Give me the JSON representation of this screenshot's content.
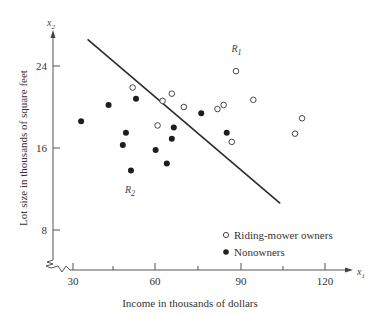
{
  "chart_data": {
    "type": "scatter",
    "title": "",
    "xlabel": "Income in thousands of dollars",
    "ylabel": "Lot size in thousands of square feet",
    "x_axis_var": "x1",
    "y_axis_var": "x2",
    "xlim": [
      27,
      130
    ],
    "ylim": [
      1.5,
      28
    ],
    "x_ticks": [
      30,
      45,
      60,
      75,
      90,
      105,
      120
    ],
    "x_tick_labels": [
      "30",
      "",
      "60",
      "",
      "90",
      "",
      "120"
    ],
    "y_ticks": [
      8,
      16,
      24
    ],
    "y_tick_labels": [
      "8",
      "16",
      "24"
    ],
    "grid": false,
    "axis_breaks": true,
    "legend_position": "lower right",
    "series": [
      {
        "name": "Riding-mower owners",
        "marker": "open-circle",
        "points": [
          [
            51.3,
            21.9
          ],
          [
            62.0,
            20.6
          ],
          [
            65.3,
            21.3
          ],
          [
            69.6,
            20.0
          ],
          [
            60.2,
            18.2
          ],
          [
            81.6,
            19.8
          ],
          [
            83.8,
            20.2
          ],
          [
            88.2,
            23.5
          ],
          [
            94.4,
            20.7
          ],
          [
            86.7,
            16.6
          ],
          [
            109.3,
            17.4
          ],
          [
            111.8,
            18.9
          ]
        ]
      },
      {
        "name": "Nonowners",
        "marker": "filled-circle",
        "points": [
          [
            32.9,
            18.6
          ],
          [
            42.7,
            20.2
          ],
          [
            52.5,
            20.8
          ],
          [
            48.9,
            17.5
          ],
          [
            47.8,
            16.3
          ],
          [
            50.7,
            13.8
          ],
          [
            59.5,
            15.8
          ],
          [
            63.5,
            14.5
          ],
          [
            65.3,
            16.9
          ],
          [
            66.0,
            18.0
          ],
          [
            75.8,
            19.4
          ],
          [
            84.9,
            17.5
          ]
        ]
      }
    ],
    "decision_line": {
      "from": [
        35.2,
        26.6
      ],
      "to": [
        104.0,
        10.6
      ]
    },
    "region_labels": [
      {
        "label": "R1",
        "x": 88,
        "y": 25.8
      },
      {
        "label": "R2",
        "x": 50,
        "y": 12.0
      }
    ]
  },
  "labels": {
    "x_var": "x",
    "x_var_sub": "1",
    "y_var": "x",
    "y_var_sub": "2",
    "r1": "R",
    "r1_sub": "1",
    "r2": "R",
    "r2_sub": "2",
    "xlabel": "Income in thousands of dollars",
    "ylabel": "Lot size in thousands of square feet",
    "legend_owners": "Riding-mower owners",
    "legend_nonowners": "Nonowners",
    "tick_x_30": "30",
    "tick_x_60": "60",
    "tick_x_90": "90",
    "tick_x_120": "120",
    "tick_y_8": "8",
    "tick_y_16": "16",
    "tick_y_24": "24"
  },
  "colors": {
    "ink": "#222222",
    "axis": "#555555"
  }
}
